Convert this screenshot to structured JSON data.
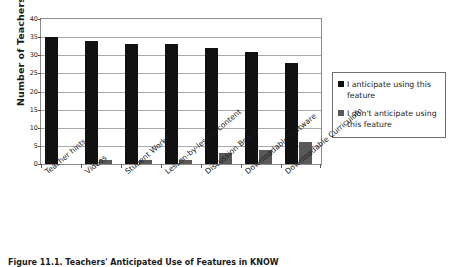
{
  "chart_data": {
    "type": "bar",
    "title": "",
    "xlabel": "",
    "ylabel": "Number of Teachers",
    "ylim": [
      0,
      40
    ],
    "ytick_step": 5,
    "yticks": [
      0,
      5,
      10,
      15,
      20,
      25,
      30,
      35,
      40
    ],
    "grid": "horizontal",
    "legend_position": "right",
    "categories": [
      "Teacher hints",
      "Videos",
      "Student Work",
      "Lesson-by-lesson content",
      "Discussion Board",
      "Downloadable Software",
      "Downloadable Curriculum"
    ],
    "series": [
      {
        "name": "I anticipate using this feature",
        "color": "#111111",
        "values": [
          35,
          34,
          33,
          33,
          32,
          31,
          28
        ]
      },
      {
        "name": "I don't anticipate using this feature",
        "color": "#595959",
        "values": [
          0,
          1,
          1,
          1,
          3,
          4,
          6
        ]
      }
    ]
  },
  "legend": {
    "entries": [
      {
        "label": "I anticipate using this feature",
        "swatch": "black-square-marker"
      },
      {
        "label": "I don't anticipate using this feature",
        "swatch": "gray-square-marker"
      }
    ]
  },
  "caption": {
    "text": "Figure 11.1.  Teachers' Anticipated Use of Features in KNOW"
  }
}
